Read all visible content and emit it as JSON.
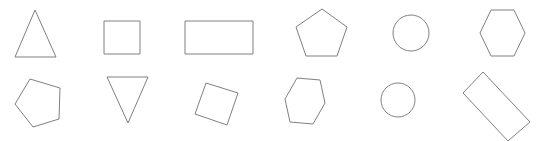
{
  "canvas": {
    "width": 542,
    "height": 141,
    "background_color": "#ffffff",
    "stroke_color": "#808080",
    "fill_color": "#ffffff",
    "stroke_width": 1,
    "rows": 2,
    "columns": 6,
    "total_shapes": 12
  },
  "shapes": [
    {
      "id": "shape-r1c1",
      "name": "triangle-up",
      "label": "Triangle",
      "row": 1,
      "column": 1,
      "geometry": "polygon",
      "rotation_deg": 0,
      "center": {
        "x": 35,
        "y": 41
      },
      "points": "35,10 56,57 15,57"
    },
    {
      "id": "shape-r1c2",
      "name": "square",
      "label": "Square",
      "row": 1,
      "column": 2,
      "geometry": "polygon",
      "rotation_deg": 0,
      "center": {
        "x": 122,
        "y": 37
      },
      "points": "104,21 140,21 140,54 104,54"
    },
    {
      "id": "shape-r1c3",
      "name": "rectangle",
      "label": "Rectangle",
      "row": 1,
      "column": 3,
      "geometry": "polygon",
      "rotation_deg": 0,
      "center": {
        "x": 219,
        "y": 37
      },
      "points": "185,21 253,21 253,54 185,54"
    },
    {
      "id": "shape-r1c4",
      "name": "pentagon",
      "label": "Pentagon",
      "row": 1,
      "column": 4,
      "geometry": "polygon",
      "rotation_deg": 0,
      "center": {
        "x": 322,
        "y": 35
      },
      "points": "322,9 347,27 337,56 306,56 296,27"
    },
    {
      "id": "shape-r1c5",
      "name": "circle",
      "label": "Circle",
      "row": 1,
      "column": 5,
      "geometry": "circle",
      "rotation_deg": 0,
      "center": {
        "x": 411,
        "y": 33
      },
      "radius": 18
    },
    {
      "id": "shape-r1c6",
      "name": "hexagon",
      "label": "Hexagon",
      "row": 1,
      "column": 6,
      "geometry": "polygon",
      "rotation_deg": 0,
      "center": {
        "x": 502,
        "y": 33
      },
      "points": "491,10 514,10 525,33 514,56 491,56 480,33"
    },
    {
      "id": "shape-r2c1",
      "name": "pentagon-rotated",
      "label": "Pentagon",
      "row": 2,
      "column": 1,
      "geometry": "polygon",
      "rotation_deg": -15,
      "center": {
        "x": 37,
        "y": 103
      },
      "points": "30,79 60,88 59,119 33,127 15,104"
    },
    {
      "id": "shape-r2c2",
      "name": "triangle-down",
      "label": "Triangle",
      "row": 2,
      "column": 2,
      "geometry": "polygon",
      "rotation_deg": 180,
      "center": {
        "x": 128,
        "y": 92
      },
      "points": "107,77 148,77 128,123"
    },
    {
      "id": "shape-r2c3",
      "name": "square-rotated",
      "label": "Square",
      "row": 2,
      "column": 3,
      "geometry": "polygon",
      "rotation_deg": 15,
      "center": {
        "x": 216,
        "y": 104
      },
      "points": "206,83 238,93 227,125 195,114"
    },
    {
      "id": "shape-r2c4",
      "name": "hexagon-rotated",
      "label": "Hexagon",
      "row": 2,
      "column": 4,
      "geometry": "polygon",
      "rotation_deg": -6,
      "center": {
        "x": 305,
        "y": 101
      },
      "points": "297,78 320,80 325,103 313,124 290,122 285,99"
    },
    {
      "id": "shape-r2c5",
      "name": "circle",
      "label": "Circle",
      "row": 2,
      "column": 5,
      "geometry": "circle",
      "rotation_deg": 0,
      "center": {
        "x": 398,
        "y": 100
      },
      "radius": 17
    },
    {
      "id": "shape-r2c6",
      "name": "rectangle-rotated",
      "label": "Rectangle",
      "row": 2,
      "column": 6,
      "geometry": "polygon",
      "rotation_deg": 48,
      "center": {
        "x": 496,
        "y": 106
      },
      "points": "483,72 530,122 508,141 463,93"
    }
  ]
}
